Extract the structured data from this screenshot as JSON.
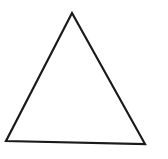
{
  "canvas": {
    "width": 168,
    "height": 159,
    "background_color": "#ffffff",
    "alt_text": "Triangle outline"
  },
  "figure": {
    "name": "triangle",
    "shape_type": "triangle",
    "label": "",
    "fill_color": "#ffffff",
    "stroke_color": "#1a1a1a",
    "stroke_width": 2.2,
    "vertices": [
      {
        "name": "apex",
        "x": 72,
        "y": 13
      },
      {
        "name": "bottom-right",
        "x": 145,
        "y": 144
      },
      {
        "name": "bottom-left",
        "x": 6,
        "y": 141
      }
    ],
    "points_string": "72,13 145,144 6,141"
  }
}
